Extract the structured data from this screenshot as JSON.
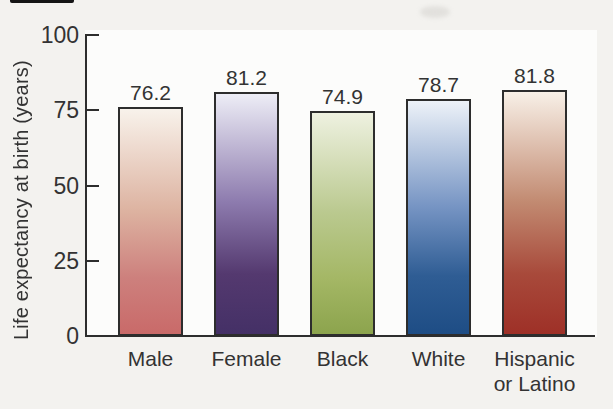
{
  "chart_data": {
    "type": "bar",
    "title": "",
    "ylabel": "Life expectancy at birth (years)",
    "xlabel": "",
    "ylim": [
      0,
      100
    ],
    "yticks": [
      100,
      75,
      50,
      25,
      0
    ],
    "ytick_labels": [
      "100",
      "75",
      "50",
      "25",
      "0"
    ],
    "grid": false,
    "legend": false,
    "categories": [
      "Male",
      "Female",
      "Black",
      "White",
      "Hispanic or Latino"
    ],
    "values": [
      76.2,
      81.2,
      74.9,
      78.7,
      81.8
    ],
    "value_labels": [
      "76.2",
      "81.2",
      "74.9",
      "78.7",
      "81.8"
    ],
    "bar_gradients": [
      {
        "category": "Male",
        "top": "#f8f2eb",
        "mid": "#ddb3a1",
        "low": "#cd807d",
        "bottom": "#c96a69"
      },
      {
        "category": "Female",
        "top": "#ededf6",
        "mid": "#8d7bae",
        "low": "#54396f",
        "bottom": "#443066"
      },
      {
        "category": "Black",
        "top": "#eef1e0",
        "mid": "#bac98f",
        "low": "#a4b765",
        "bottom": "#8ca44d"
      },
      {
        "category": "White",
        "top": "#edf2f8",
        "mid": "#7795c4",
        "low": "#2f5d94",
        "bottom": "#1e4d85"
      },
      {
        "category": "Hispanic or Latino",
        "top": "#f8f0e7",
        "mid": "#c28b72",
        "low": "#a84a3b",
        "bottom": "#9e3027"
      }
    ],
    "axis_color": "#2d2d2d",
    "text_color": "#333333"
  }
}
